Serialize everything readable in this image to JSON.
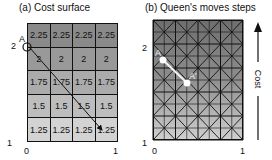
{
  "panel_a": {
    "title": "(a) Cost surface",
    "rows": [
      {
        "values": [
          "2.25",
          "2.25",
          "2.25",
          "2.25"
        ],
        "color": "#8a8a8a"
      },
      {
        "values": [
          "2",
          "2",
          "2",
          "2"
        ],
        "color": "#999999"
      },
      {
        "values": [
          "1.75",
          "1.75",
          "1.75",
          "1.75"
        ],
        "color": "#ababab"
      },
      {
        "values": [
          "1.5",
          "1.5",
          "1.5",
          "1.5"
        ],
        "color": "#bdbdbd"
      },
      {
        "values": [
          "1.25",
          "1.25",
          "1.25",
          "1.25"
        ],
        "color": "#d3d3d3"
      }
    ],
    "point_label": "A",
    "y_tick_top": "2",
    "y_tick_bottom": "1",
    "x_tick_left": "0",
    "x_tick_right": "1"
  },
  "panel_b": {
    "title": "(b) Queen's moves steps",
    "start_label": "A",
    "end_label": "A'",
    "y_tick_top": "2",
    "y_tick_bottom": "1",
    "x_tick_left": "0",
    "x_tick_right": "1",
    "gradient_top": "#6e6e6e",
    "gradient_bottom": "#cfcfcf"
  },
  "cost_arrow": {
    "label": "Cost"
  }
}
